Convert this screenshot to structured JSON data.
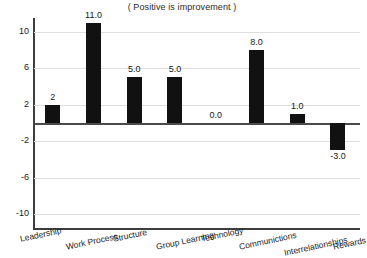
{
  "chart_data": {
    "type": "bar",
    "title": "( Positive is improvement )",
    "xlabel": "",
    "ylabel": "",
    "ylim": [
      -11.5,
      11.5
    ],
    "yticks": [
      10,
      6,
      2,
      -2,
      -6,
      -10
    ],
    "ytick_labels": [
      "10",
      "6",
      "2",
      "-2",
      "-6",
      "-10"
    ],
    "grid": true,
    "legend": "none",
    "zero_line": true,
    "bar_color": "#111111",
    "categories": [
      "Leadership",
      "Work Process",
      "Structure",
      "Group Learning",
      "Technology",
      "Communictions",
      "Interrelationships",
      "Rewards"
    ],
    "values": [
      2,
      11.0,
      5.0,
      5.0,
      0.0,
      8.0,
      1.0,
      -3.0
    ],
    "data_labels": [
      "2",
      "11.0",
      "5.0",
      "5.0",
      "0.0",
      "8.0",
      "1.0",
      "-3.0"
    ]
  },
  "axis": {
    "ytick_labels": [
      "10",
      "6",
      "2",
      "-2",
      "-6",
      "-10"
    ]
  }
}
